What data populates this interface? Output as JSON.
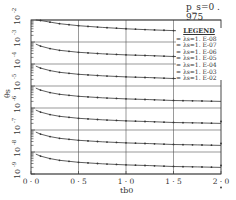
{
  "chart_data": {
    "type": "line",
    "title": "",
    "annotation": "p_s=0 . 975",
    "xlabel": "t_b0",
    "ylabel": "θ_s",
    "x_scale": "linear",
    "y_scale": "log",
    "xlim": [
      0.0,
      2.0
    ],
    "ylim": [
      1e-09,
      0.01
    ],
    "x_ticks": [
      "0 . 0",
      "0 . 5",
      "1 . 0",
      "1 . 5",
      "2 . 0"
    ],
    "y_ticks": [
      "10^-2",
      "10^-3",
      "10^-4",
      "10^-5",
      "10^-6",
      "10^-7",
      "10^-8",
      "10^-9"
    ],
    "grid": true,
    "legend_position": "upper right",
    "legend_title": "LEGEND",
    "series_to_curve_mapping_note": "Assumed, not verified: markers were not resolvable in the screenshot; mapped by assuming smaller λ_s gives a lower curve.",
    "x": [
      0.05,
      0.1,
      0.2,
      0.3,
      0.5,
      0.75,
      1.0,
      1.25,
      1.5,
      1.75,
      2.0
    ],
    "series": [
      {
        "name": "λ_s=1. E-02",
        "values": [
          0.01,
          0.0095,
          0.008,
          0.0068,
          0.0055,
          0.0046,
          0.004,
          0.0036,
          0.0033,
          0.003,
          0.0028
        ]
      },
      {
        "name": "λ_s=1. E-03",
        "values": [
          0.0008,
          0.00065,
          0.0005,
          0.00042,
          0.00034,
          0.00029,
          0.00026,
          0.00024,
          0.00022,
          0.00021,
          0.0002
        ]
      },
      {
        "name": "λ_s=1. E-04",
        "values": [
          8e-05,
          6.5e-05,
          5e-05,
          4.2e-05,
          3.4e-05,
          2.9e-05,
          2.6e-05,
          2.4e-05,
          2.2e-05,
          2.1e-05,
          2e-05
        ]
      },
      {
        "name": "λ_s=1. E-05",
        "values": [
          8e-06,
          6.5e-06,
          5e-06,
          4.2e-06,
          3.4e-06,
          2.9e-06,
          2.6e-06,
          2.4e-06,
          2.2e-06,
          2.1e-06,
          2e-06
        ]
      },
      {
        "name": "λ_s=1. E-06",
        "values": [
          8e-07,
          6.5e-07,
          5e-07,
          4.2e-07,
          3.4e-07,
          2.9e-07,
          2.6e-07,
          2.4e-07,
          2.2e-07,
          2.1e-07,
          2e-07
        ]
      },
      {
        "name": "λ_s=1. E-07",
        "values": [
          8e-08,
          6.5e-08,
          5e-08,
          4.2e-08,
          3.4e-08,
          2.9e-08,
          2.6e-08,
          2.4e-08,
          2.2e-08,
          2.1e-08,
          2e-08
        ]
      },
      {
        "name": "λ_s=1. E-08",
        "values": [
          8e-09,
          6.5e-09,
          5e-09,
          4.2e-09,
          3.4e-09,
          2.9e-09,
          2.6e-09,
          2.4e-09,
          2.2e-09,
          2.1e-09,
          2e-09
        ]
      }
    ]
  },
  "annotation_text": "p_s=0 . 975",
  "legend": {
    "title": "LEGEND",
    "items": [
      "= λs=1. E-08",
      "= λs=1. E-07",
      "= λs=1. E-06",
      "= λs=1. E-05",
      "= λs=1. E-04",
      "= λs=1. E-03",
      "= λs=1. E-02"
    ]
  },
  "axes": {
    "xlabel": "tb0",
    "ylabel": "θs",
    "x_tick_labels": [
      "0 · 0",
      "0 · 5",
      "1 · 0",
      "1 · 5",
      "2 · 0"
    ],
    "y_tick_bases": [
      "10",
      "10",
      "10",
      "10",
      "10",
      "10",
      "10",
      "10"
    ],
    "y_tick_exps": [
      "-2",
      "-3",
      "-4",
      "-5",
      "-6",
      "-7",
      "-8",
      "-9"
    ]
  },
  "colors": {
    "line": "#333333",
    "grid": "#555555",
    "background": "#ffffff"
  }
}
